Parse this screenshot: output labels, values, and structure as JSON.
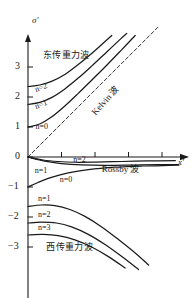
{
  "figure": {
    "axis_y_label": "σ′",
    "axis_x_label": "x′"
  },
  "chart_data": {
    "type": "line",
    "title": "",
    "xlabel": "x′",
    "ylabel": "σ′",
    "xlim": [
      0,
      4.6
    ],
    "ylim": [
      -3.5,
      3.9
    ],
    "grid": false,
    "legend": "none",
    "yticks": [
      "3",
      "2",
      "1",
      "0",
      "−1",
      "−2",
      "−3"
    ],
    "ytick_values": [
      3,
      2,
      1,
      0,
      -1,
      -2,
      -3
    ],
    "xticks": [
      "",
      "",
      "",
      ""
    ],
    "xtick_values": [
      1,
      2,
      3,
      4
    ],
    "annotations": [
      {
        "text": "东传重力波",
        "x": 0.45,
        "y": 3.35
      },
      {
        "text": "西传重力波",
        "x": 0.55,
        "y": -3.05
      },
      {
        "text": "Kelvin 波",
        "x": 2.05,
        "y": 1.45
      },
      {
        "text": "Rossby 波",
        "x": 2.2,
        "y": -0.45
      },
      {
        "text": "n=2",
        "x": 0.22,
        "y": 2.22
      },
      {
        "text": "n=1",
        "x": 0.22,
        "y": 1.66
      },
      {
        "text": "n=0",
        "x": 0.22,
        "y": 0.92
      },
      {
        "text": "n=2",
        "x": 1.35,
        "y": -0.17
      },
      {
        "text": "n=1",
        "x": 0.2,
        "y": -0.52
      },
      {
        "text": "n=0",
        "x": 0.95,
        "y": -0.82
      },
      {
        "text": "n=1",
        "x": 0.3,
        "y": -1.45
      },
      {
        "text": "n=2",
        "x": 0.3,
        "y": -2.0
      },
      {
        "text": "n=3",
        "x": 0.3,
        "y": -2.42
      }
    ],
    "series": [
      {
        "name": "east-gravity-n2",
        "points": [
          [
            0,
            2.35
          ],
          [
            0.35,
            2.4
          ],
          [
            0.7,
            2.52
          ],
          [
            1.1,
            2.75
          ],
          [
            1.5,
            3.08
          ],
          [
            1.9,
            3.45
          ],
          [
            2.3,
            3.85
          ],
          [
            2.5,
            4.05
          ]
        ]
      },
      {
        "name": "east-gravity-n1",
        "points": [
          [
            0,
            1.75
          ],
          [
            0.35,
            1.82
          ],
          [
            0.7,
            1.98
          ],
          [
            1.1,
            2.27
          ],
          [
            1.5,
            2.63
          ],
          [
            1.9,
            3.03
          ],
          [
            2.35,
            3.5
          ],
          [
            2.75,
            3.92
          ],
          [
            2.95,
            4.12
          ]
        ]
      },
      {
        "name": "east-gravity-n0",
        "points": [
          [
            0,
            1.0
          ],
          [
            0.35,
            1.1
          ],
          [
            0.7,
            1.33
          ],
          [
            1.1,
            1.7
          ],
          [
            1.5,
            2.12
          ],
          [
            1.9,
            2.56
          ],
          [
            2.35,
            3.06
          ],
          [
            2.8,
            3.58
          ],
          [
            3.2,
            4.05
          ]
        ]
      },
      {
        "name": "kelvin-dashed",
        "points": [
          [
            0,
            0
          ],
          [
            3.9,
            4.35
          ]
        ],
        "dashed": true
      },
      {
        "name": "rossby-n2",
        "points": [
          [
            0,
            0
          ],
          [
            0.45,
            -0.1
          ],
          [
            0.9,
            -0.15
          ],
          [
            1.4,
            -0.175
          ],
          [
            2.0,
            -0.17
          ],
          [
            2.8,
            -0.15
          ],
          [
            3.6,
            -0.13
          ],
          [
            4.4,
            -0.12
          ]
        ]
      },
      {
        "name": "rossby-n1",
        "points": [
          [
            0,
            0
          ],
          [
            0.5,
            -0.14
          ],
          [
            1.0,
            -0.22
          ],
          [
            1.6,
            -0.265
          ],
          [
            2.3,
            -0.28
          ],
          [
            3.1,
            -0.27
          ],
          [
            3.9,
            -0.255
          ],
          [
            4.5,
            -0.25
          ]
        ]
      },
      {
        "name": "rossby-n0",
        "points": [
          [
            0,
            -1.0
          ],
          [
            0.3,
            -0.85
          ],
          [
            0.7,
            -0.68
          ],
          [
            1.2,
            -0.53
          ],
          [
            1.8,
            -0.42
          ],
          [
            2.6,
            -0.34
          ],
          [
            3.4,
            -0.3
          ],
          [
            4.2,
            -0.28
          ],
          [
            4.5,
            -0.275
          ]
        ]
      },
      {
        "name": "west-gravity-n1",
        "points": [
          [
            0,
            -1.65
          ],
          [
            0.4,
            -1.6
          ],
          [
            0.8,
            -1.62
          ],
          [
            1.25,
            -1.75
          ],
          [
            1.7,
            -1.98
          ],
          [
            2.2,
            -2.33
          ],
          [
            2.7,
            -2.75
          ],
          [
            3.2,
            -3.2
          ],
          [
            3.6,
            -3.6
          ]
        ]
      },
      {
        "name": "west-gravity-n2",
        "points": [
          [
            0,
            -2.2
          ],
          [
            0.4,
            -2.17
          ],
          [
            0.85,
            -2.2
          ],
          [
            1.3,
            -2.33
          ],
          [
            1.8,
            -2.58
          ],
          [
            2.3,
            -2.92
          ],
          [
            2.8,
            -3.32
          ],
          [
            3.3,
            -3.75
          ]
        ]
      },
      {
        "name": "west-gravity-n3",
        "points": [
          [
            0,
            -2.6
          ],
          [
            0.45,
            -2.58
          ],
          [
            0.9,
            -2.62
          ],
          [
            1.4,
            -2.76
          ],
          [
            1.9,
            -3.0
          ],
          [
            2.4,
            -3.32
          ],
          [
            2.9,
            -3.7
          ]
        ]
      }
    ]
  }
}
